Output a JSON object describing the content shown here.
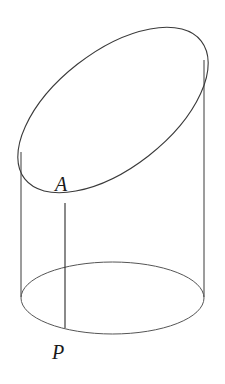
{
  "diagram": {
    "type": "oblique-cut-cylinder",
    "labels": {
      "A": "A",
      "P": "P"
    },
    "colors": {
      "stroke": "#3a3a3a",
      "background": "#ffffff"
    }
  }
}
